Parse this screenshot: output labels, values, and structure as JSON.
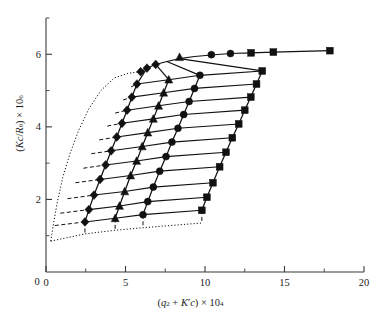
{
  "chart_data": {
    "type": "scatter",
    "title": "",
    "subtitle": "",
    "xlabel_plain": "(q^2 + K'c) x 10^4",
    "ylabel_plain": "(Kc/R_theta) x 10^6",
    "xlabel_parts": {
      "open": "(",
      "q": "q",
      "qsup": "2",
      "plus": " + ",
      "k": "K",
      "prime": "′",
      "c": "c",
      "close": ")",
      "times": " × 10",
      "exp": "4"
    },
    "ylabel_parts": {
      "open": "(",
      "k": "K",
      "c": "c",
      "slash": "/",
      "r": "R",
      "sub": "θ",
      "close": ")",
      "times": " × 10",
      "exp": "6"
    },
    "xlim": [
      0,
      20
    ],
    "ylim": [
      0,
      7
    ],
    "xticks": [
      0,
      5,
      10,
      15,
      20
    ],
    "xticklabels": [
      "0",
      "5",
      "10",
      "15",
      "20"
    ],
    "xminor": [
      2.5,
      7.5,
      12.5,
      17.5
    ],
    "yticks": [
      0,
      2,
      4,
      6
    ],
    "yticklabels": [
      "0",
      "2",
      "4",
      "6"
    ],
    "yminor": [
      1,
      3,
      5,
      7
    ],
    "grid": false,
    "legend": "none",
    "marker_names": [
      "square",
      "circle",
      "triangle",
      "diamond"
    ],
    "series": [
      {
        "name": "c1",
        "marker": "diamond",
        "linestyle": "solid",
        "x": [
          2.45,
          2.7,
          3.02,
          3.4,
          3.75,
          4.1,
          4.45,
          4.78,
          5.1,
          5.4,
          5.72
        ],
        "y": [
          1.38,
          1.72,
          2.12,
          2.55,
          2.95,
          3.34,
          3.72,
          4.1,
          4.46,
          4.82,
          5.18
        ]
      },
      {
        "name": "c2",
        "marker": "triangle",
        "linestyle": "solid",
        "x": [
          4.35,
          4.62,
          4.95,
          5.32,
          5.7,
          6.05,
          6.4,
          6.75,
          7.08,
          7.4,
          7.72
        ],
        "y": [
          1.48,
          1.82,
          2.22,
          2.66,
          3.06,
          3.46,
          3.84,
          4.22,
          4.58,
          4.94,
          5.3
        ]
      },
      {
        "name": "c3",
        "marker": "circle",
        "linestyle": "solid",
        "x": [
          6.1,
          6.4,
          6.75,
          7.15,
          7.55,
          7.92,
          8.3,
          8.66,
          9.0,
          9.34,
          9.68
        ],
        "y": [
          1.58,
          1.94,
          2.34,
          2.78,
          3.18,
          3.58,
          3.96,
          4.34,
          4.7,
          5.06,
          5.42
        ]
      },
      {
        "name": "c4",
        "marker": "square",
        "linestyle": "solid",
        "x": [
          9.8,
          10.12,
          10.5,
          10.92,
          11.32,
          11.72,
          12.12,
          12.5,
          12.88,
          13.24,
          13.6
        ],
        "y": [
          1.7,
          2.06,
          2.46,
          2.9,
          3.3,
          3.7,
          4.08,
          4.46,
          4.82,
          5.18,
          5.54
        ]
      }
    ],
    "angle_lines": {
      "count": 11,
      "description": "Constant-angle lines connecting the four concentrations, extrapolated to c = 0",
      "c_zero_x": [
        0.55,
        0.9,
        1.35,
        1.85,
        2.35,
        2.85,
        3.35,
        3.85,
        4.35,
        4.85,
        5.35
      ],
      "c_zero_y": [
        1.28,
        1.62,
        2.02,
        2.46,
        2.86,
        3.26,
        3.64,
        4.02,
        4.38,
        4.74,
        5.1
      ]
    },
    "top_curve": {
      "description": "Top boundary line (highest angle) through topmost points",
      "x": [
        5.95,
        6.35,
        6.9,
        7.6,
        8.4,
        9.35,
        10.4,
        11.6,
        12.9,
        14.3,
        17.85
      ],
      "y": [
        5.52,
        5.62,
        5.72,
        5.8,
        5.88,
        5.94,
        5.98,
        6.02,
        6.04,
        6.06,
        6.1
      ]
    },
    "zero_angle_curve": {
      "description": "Dotted theta = 0 extrapolation curve on the left",
      "x": [
        0.3,
        0.45,
        0.7,
        1.05,
        1.5,
        2.05,
        2.7,
        3.45,
        4.3,
        5.2,
        5.95
      ],
      "y": [
        0.85,
        1.28,
        1.9,
        2.6,
        3.25,
        3.9,
        4.5,
        5.0,
        5.35,
        5.48,
        5.52
      ]
    },
    "zero_conc_curve": {
      "description": "Dotted c = 0 extrapolation curve along the bottom",
      "x": [
        0.3,
        2.45,
        4.35,
        6.1,
        9.8
      ],
      "y": [
        0.85,
        1.05,
        1.15,
        1.22,
        1.35
      ]
    }
  }
}
